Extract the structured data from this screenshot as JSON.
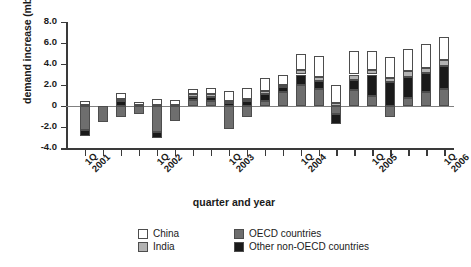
{
  "chart_data": {
    "type": "bar",
    "stacked": true,
    "title": "",
    "xlabel": "quarter and year",
    "ylabel": "demand increase (mbd)",
    "ylim": [
      -4.0,
      8.0
    ],
    "yticks": [
      "8.0",
      "6.0",
      "4.0",
      "2.0",
      "0",
      "-2.0",
      "-4.0"
    ],
    "ytick_values": [
      8.0,
      6.0,
      4.0,
      2.0,
      0,
      -2.0,
      -4.0
    ],
    "grid": false,
    "legend_position": "bottom",
    "categories": [
      "1Q 2001",
      "2Q 2001",
      "3Q 2001",
      "4Q 2001",
      "1Q 2002",
      "2Q 2002",
      "3Q 2002",
      "4Q 2002",
      "1Q 2003",
      "2Q 2003",
      "3Q 2003",
      "4Q 2003",
      "1Q 2004",
      "2Q 2004",
      "3Q 2004",
      "4Q 2004",
      "1Q 2005",
      "2Q 2005",
      "3Q 2005",
      "4Q 2005",
      "1Q 2006"
    ],
    "xtick_labels": [
      {
        "index": 0,
        "quarter": "1Q",
        "year": "2001"
      },
      {
        "index": 4,
        "quarter": "1Q",
        "year": "2002"
      },
      {
        "index": 8,
        "quarter": "1Q",
        "year": "2003"
      },
      {
        "index": 12,
        "quarter": "1Q",
        "year": "2004"
      },
      {
        "index": 16,
        "quarter": "1Q",
        "year": "2005"
      },
      {
        "index": 20,
        "quarter": "1Q",
        "year": "2006"
      }
    ],
    "series": [
      {
        "name": "China",
        "color": "#ffffff",
        "values": [
          0.4,
          0.0,
          0.5,
          0.3,
          0.6,
          0.5,
          0.5,
          0.6,
          0.9,
          1.0,
          1.3,
          1.0,
          1.6,
          2.0,
          1.7,
          2.2,
          1.8,
          2.0,
          2.1,
          2.3,
          2.2
        ]
      },
      {
        "name": "India",
        "color": "#b3b3b3",
        "values": [
          0.1,
          0.0,
          0.2,
          0.1,
          0.1,
          0.1,
          0.2,
          0.2,
          0.2,
          0.2,
          0.3,
          0.2,
          0.4,
          0.4,
          0.3,
          0.5,
          0.4,
          0.4,
          0.5,
          0.5,
          0.6
        ]
      },
      {
        "name": "OECD countries",
        "color": "#6e6e6e",
        "values": [
          -2.3,
          -1.5,
          -1.0,
          -0.8,
          -2.5,
          -1.4,
          0.6,
          0.5,
          -2.2,
          -1.0,
          0.5,
          1.3,
          2.0,
          1.6,
          -0.8,
          1.5,
          1.0,
          -1.0,
          0.8,
          1.3,
          1.6
        ]
      },
      {
        "name": "Other non-OECD countries",
        "color": "#1a1a1a",
        "values": [
          -0.6,
          0.0,
          0.5,
          0.0,
          -0.5,
          0.0,
          0.3,
          0.4,
          0.3,
          0.5,
          0.6,
          0.5,
          1.0,
          0.8,
          -0.9,
          1.0,
          2.0,
          2.3,
          2.0,
          1.8,
          2.2
        ]
      }
    ]
  },
  "legend": {
    "items": [
      {
        "label": "China",
        "color": "#ffffff"
      },
      {
        "label": "OECD countries",
        "color": "#6e6e6e"
      },
      {
        "label": "India",
        "color": "#b3b3b3"
      },
      {
        "label": "Other non-OECD countries",
        "color": "#1a1a1a"
      }
    ]
  }
}
